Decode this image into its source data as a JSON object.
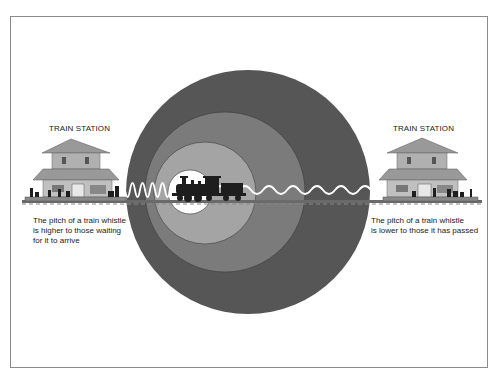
{
  "diagram": {
    "left_station": {
      "label": "TRAIN STATION",
      "caption_lines": [
        "The pitch of a train whistle",
        "is higher to those waiting",
        "for it to arrive"
      ]
    },
    "right_station": {
      "label": "TRAIN STATION",
      "caption_lines": [
        "The pitch of a train whistle",
        "is lower to those it has passed"
      ]
    },
    "wavefronts": {
      "count": 4,
      "colors": [
        "#555555",
        "#7a7a7a",
        "#a3a3a3",
        "#ffffff"
      ]
    },
    "waves": {
      "left": "compressed (high pitch)",
      "right": "stretched (low pitch)",
      "color": "#ffffff"
    },
    "icons": {
      "train": "steam-locomotive-icon",
      "station": "train-station-building-icon"
    }
  }
}
